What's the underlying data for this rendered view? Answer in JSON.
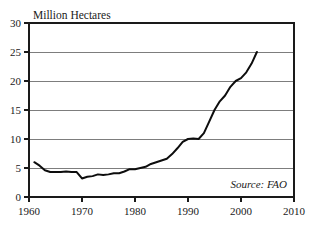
{
  "chart_data": {
    "type": "line",
    "title": "Million Hectares",
    "xlabel": "",
    "ylabel": "Million Hectares",
    "xlim": [
      1960,
      2010
    ],
    "ylim": [
      0,
      30
    ],
    "grid": true,
    "legend": false,
    "annotation": "Source: FAO",
    "xticks": [
      1960,
      1970,
      1980,
      1990,
      2000,
      2010
    ],
    "yticks": [
      0,
      5,
      10,
      15,
      20,
      25,
      30
    ],
    "series": [
      {
        "name": "Area",
        "x": [
          1961,
          1962,
          1963,
          1964,
          1965,
          1966,
          1967,
          1968,
          1969,
          1970,
          1971,
          1972,
          1973,
          1974,
          1975,
          1976,
          1977,
          1978,
          1979,
          1980,
          1981,
          1982,
          1983,
          1984,
          1985,
          1986,
          1987,
          1988,
          1989,
          1990,
          1991,
          1992,
          1993,
          1994,
          1995,
          1996,
          1997,
          1998,
          1999,
          2000,
          2001,
          2002,
          2003
        ],
        "values": [
          6.0,
          5.4,
          4.6,
          4.3,
          4.3,
          4.3,
          4.4,
          4.3,
          4.3,
          3.2,
          3.5,
          3.6,
          3.9,
          3.8,
          3.9,
          4.1,
          4.1,
          4.4,
          4.8,
          4.8,
          5.0,
          5.2,
          5.7,
          6.0,
          6.3,
          6.6,
          7.4,
          8.4,
          9.5,
          10.0,
          10.1,
          10.0,
          11.0,
          13.0,
          15.0,
          16.5,
          17.5,
          19.0,
          20.0,
          20.5,
          21.5,
          23.0,
          25.0
        ]
      }
    ]
  }
}
